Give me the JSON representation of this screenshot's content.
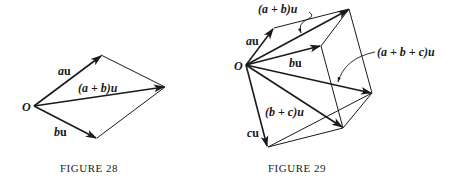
{
  "figures": [
    {
      "caption": "Figure 28",
      "caption_display": "FIGURE 28",
      "origin_label": "O",
      "labels": {
        "au": [
          "a",
          "u"
        ],
        "bu": [
          "b",
          "u"
        ],
        "sum": "(a + b)u"
      }
    },
    {
      "caption": "Figure 29",
      "caption_display": "FIGURE 29",
      "origin_label": "O",
      "labels": {
        "au": [
          "a",
          "u"
        ],
        "bu": [
          "b",
          "u"
        ],
        "cu": [
          "c",
          "u"
        ],
        "ab": "(a + b)u",
        "bc": "(b + c)u",
        "abc": "(a + b + c)u"
      }
    }
  ],
  "colors": {
    "ink": "#1a1a1a",
    "background": "#ffffff"
  }
}
